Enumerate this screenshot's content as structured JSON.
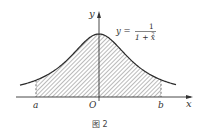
{
  "figure": {
    "caption": "图  2",
    "function_label": {
      "lhs": "y =",
      "numerator": "1",
      "denominator": "1 + x",
      "exponent": "2"
    },
    "axes": {
      "x_label": "x",
      "y_label": "y",
      "origin_label": "O"
    },
    "bounds": {
      "a_label": "a",
      "b_label": "b"
    },
    "colors": {
      "curve": "#2a2a2a",
      "axis": "#333333",
      "hatch": "#555555",
      "background": "#ffffff"
    }
  }
}
